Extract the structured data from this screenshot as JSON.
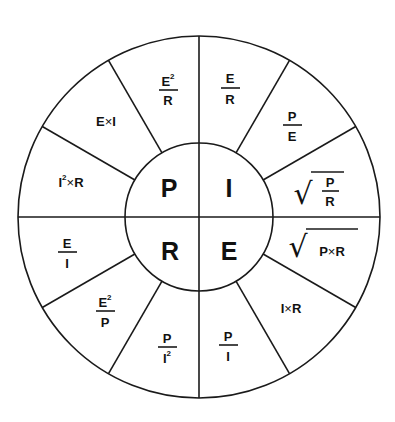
{
  "diagram": {
    "title": "",
    "center_quadrants": [
      {
        "id": "P",
        "label": "P"
      },
      {
        "id": "I",
        "label": "I"
      },
      {
        "id": "R",
        "label": "R"
      },
      {
        "id": "E",
        "label": "E"
      }
    ],
    "sectors": {
      "p_i2r": {
        "base": "I",
        "sup": "2",
        "op": "×",
        "rhs": "R"
      },
      "p_ei": {
        "lhs": "E",
        "op": "×",
        "rhs": "I"
      },
      "p_e2r": {
        "num": "E",
        "num_sup": "2",
        "den": "R"
      },
      "i_er": {
        "num": "E",
        "den": "R"
      },
      "i_pe": {
        "num": "P",
        "den": "E"
      },
      "i_sqrt_pr": {
        "num": "P",
        "den": "R"
      },
      "e_sqrt_pxr": {
        "lhs": "P",
        "op": "×",
        "rhs": "R"
      },
      "e_ixr": {
        "lhs": "I",
        "op": "×",
        "rhs": "R"
      },
      "e_pi": {
        "num": "P",
        "den": "I"
      },
      "r_pi2": {
        "num": "P",
        "den": "I",
        "den_sup": "2"
      },
      "r_e2p": {
        "num": "E",
        "num_sup": "2",
        "den": "P"
      },
      "r_ei": {
        "num": "E",
        "den": "I"
      }
    },
    "colors": {
      "line": "#1a1a1a",
      "text": "#111111",
      "background": "#ffffff"
    }
  }
}
